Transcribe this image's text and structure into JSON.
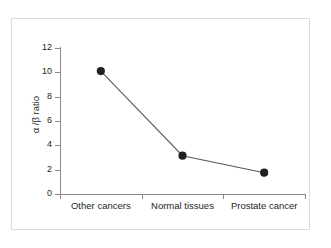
{
  "chart_data": {
    "type": "line",
    "title": "",
    "subtitle": "",
    "xlabel": "",
    "ylabel": "α /β ratio",
    "categories": [
      "Other cancers",
      "Normal tissues",
      "Prostate cancer"
    ],
    "values": [
      10.1,
      3.15,
      1.75
    ],
    "series": [
      {
        "name": "alpha/beta ratio",
        "values": [
          10.1,
          3.15,
          1.75
        ],
        "marker": "filled-circle",
        "marker_color": "#231f20",
        "line_color": "#58595b"
      }
    ],
    "ylim": [
      0,
      12
    ],
    "yticks": [
      0,
      2,
      4,
      6,
      8,
      10,
      12
    ],
    "ytick_labels": [
      "0",
      "2",
      "4",
      "6",
      "8",
      "10",
      "12"
    ],
    "xtick_labels": [
      "Other cancers",
      "Normal tissues",
      "Prostate cancer"
    ],
    "grid": false,
    "legend": false,
    "legend_position": "none",
    "axis_color": "#8a8a8a",
    "frame_color": "#dcdcdc",
    "background": "#ffffff",
    "text_color": "#231f20"
  }
}
